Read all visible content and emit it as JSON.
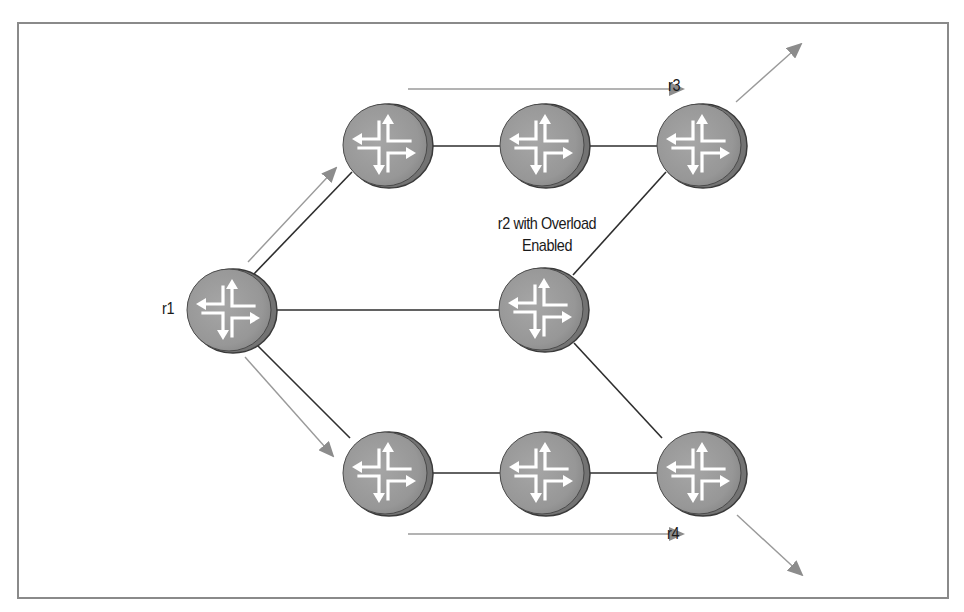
{
  "diagram": {
    "type": "network-topology",
    "colors": {
      "node_fill": "#9a9a9a",
      "node_edge": "#6e6e6e",
      "node_outline": "#3a3a3a",
      "link": "#2e2e2e",
      "traffic_arrow": "#8c8c8c",
      "frame": "#8a8a8a"
    },
    "labels": {
      "r1": "r1",
      "r2_line1": "r2 with Overload",
      "r2_line2": "Enabled",
      "r3": "r3",
      "r4": "r4"
    },
    "nodes": [
      {
        "id": "r1",
        "label": "r1",
        "icon": "router-icon"
      },
      {
        "id": "top-left",
        "label": "",
        "icon": "router-icon"
      },
      {
        "id": "top-mid",
        "label": "",
        "icon": "router-icon"
      },
      {
        "id": "r3",
        "label": "r3",
        "icon": "router-icon"
      },
      {
        "id": "r2",
        "label": "r2 with Overload Enabled",
        "icon": "router-icon"
      },
      {
        "id": "bottom-left",
        "label": "",
        "icon": "router-icon"
      },
      {
        "id": "bottom-mid",
        "label": "",
        "icon": "router-icon"
      },
      {
        "id": "r4",
        "label": "r4",
        "icon": "router-icon"
      }
    ],
    "links": [
      [
        "r1",
        "top-left"
      ],
      [
        "r1",
        "r2"
      ],
      [
        "r1",
        "bottom-left"
      ],
      [
        "top-left",
        "top-mid"
      ],
      [
        "top-mid",
        "r3"
      ],
      [
        "r2",
        "r3"
      ],
      [
        "r2",
        "r4"
      ],
      [
        "bottom-left",
        "bottom-mid"
      ],
      [
        "bottom-mid",
        "r4"
      ]
    ],
    "traffic_paths": [
      {
        "name": "r1-to-r3-via-top",
        "description": "traffic arrow r1 → top row → r3 → exit"
      },
      {
        "name": "r1-to-r4-via-bottom",
        "description": "traffic arrow r1 → bottom row → r4 → exit"
      }
    ]
  }
}
